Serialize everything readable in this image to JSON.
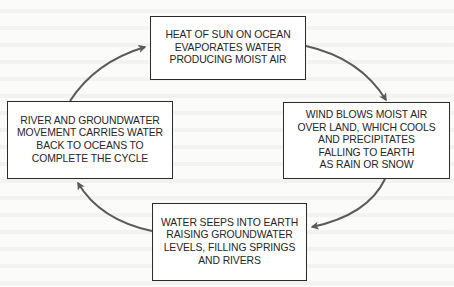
{
  "diagram": {
    "type": "cycle",
    "steps": [
      {
        "id": "evaporation",
        "position": "top",
        "text": "HEAT OF SUN ON OCEAN\nEVAPORATES WATER\nPRODUCING MOIST AIR"
      },
      {
        "id": "precipitation",
        "position": "right",
        "text": "WIND BLOWS MOIST AIR\nOVER LAND, WHICH COOLS\nAND PRECIPITATES\nFALLING TO EARTH\nAS RAIN OR SNOW"
      },
      {
        "id": "infiltration",
        "position": "bottom",
        "text": "WATER SEEPS INTO EARTH\nRAISING GROUNDWATER\nLEVELS, FILLING SPRINGS\nAND RIVERS"
      },
      {
        "id": "runoff",
        "position": "left",
        "text": "RIVER AND GROUNDWATER\nMOVEMENT CARRIES WATER\nBACK TO OCEANS TO\nCOMPLETE THE CYCLE"
      }
    ],
    "arrows": [
      {
        "from": "evaporation",
        "to": "precipitation",
        "direction": "clockwise"
      },
      {
        "from": "precipitation",
        "to": "infiltration",
        "direction": "clockwise"
      },
      {
        "from": "infiltration",
        "to": "runoff",
        "direction": "clockwise"
      },
      {
        "from": "runoff",
        "to": "evaporation",
        "direction": "clockwise"
      }
    ],
    "colors": {
      "arrow": "#5a5a5a",
      "box_border": "#2b2b2b",
      "text": "#262626",
      "background": "#fbfbfa"
    }
  }
}
